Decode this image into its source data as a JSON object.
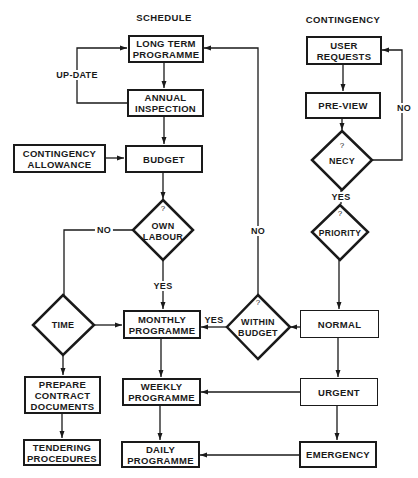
{
  "diagram": {
    "columns": {
      "schedule_title": "SCHEDULE",
      "contingency_title": "CONTINGENCY"
    },
    "schedule": {
      "long_term_programme": "LONG TERM\nPROGRAMME",
      "annual_inspection": "ANNUAL\nINSPECTION",
      "contingency_allowance": "CONTINGENCY\nALLOWANCE",
      "budget": "BUDGET",
      "own_labour": {
        "mark": "?",
        "text": "OWN\nLABOUR"
      },
      "time": "TIME",
      "monthly_programme": "MONTHLY\nPROGRAMME",
      "weekly_programme": "WEEKLY\nPROGRAMME",
      "daily_programme": "DAILY\nPROGRAMME",
      "prepare_contract_documents": "PREPARE\nCONTRACT\nDOCUMENTS",
      "tendering_procedures": "TENDERING\nPROCEDURES"
    },
    "contingency": {
      "user_requests": "USER\nREQUESTS",
      "pre_view": "PRE-VIEW",
      "necy": {
        "mark": "?",
        "text": "NECY"
      },
      "priority": {
        "mark": "?",
        "text": "PRIORITY"
      },
      "within_budget": {
        "mark": "?",
        "text": "WITHIN\nBUDGET"
      },
      "normal": "NORMAL",
      "urgent": "URGENT",
      "emergency": "EMERGENCY"
    },
    "edge_labels": {
      "update": "UP-DATE",
      "own_labour_no": "NO",
      "own_labour_yes": "YES",
      "necy_no": "NO",
      "necy_yes": "YES",
      "within_budget_no": "NO",
      "within_budget_yes": "YES"
    },
    "colors": {
      "ink": "#1a1a1a",
      "background": "#ffffff"
    }
  }
}
